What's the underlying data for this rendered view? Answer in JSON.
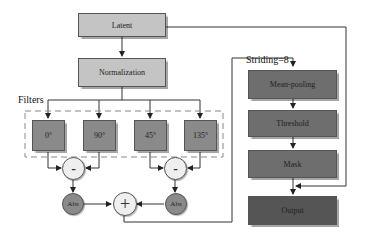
{
  "diagram": {
    "nodes": {
      "latent": "Latent",
      "normalization": "Normalization",
      "filters_label": "Filters",
      "filter_0": "0°",
      "filter_90": "90°",
      "filter_45": "45°",
      "filter_135": "135°",
      "minus_left": "-",
      "minus_right": "-",
      "abs_left": "Abs",
      "abs_right": "Abs",
      "plus": "+",
      "striding_label": "Striding=8",
      "mean_pooling": "Mean-pooling",
      "threshold": "Threshold",
      "mask": "Mask",
      "output": "Output"
    },
    "colors": {
      "light_box": "#c4c4c4",
      "filter_box": "#8a8a8a",
      "pipeline_box": "#6e6e6e",
      "output_box": "#555555",
      "line": "#333333"
    }
  }
}
